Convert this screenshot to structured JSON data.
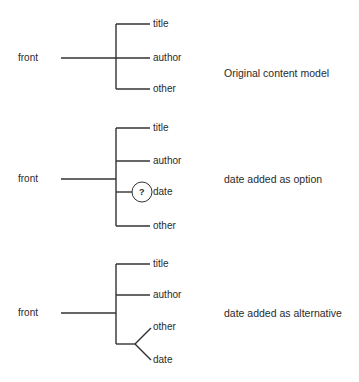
{
  "diagrams": [
    {
      "root": "front",
      "children": [
        "title",
        "author",
        "other"
      ],
      "caption": "Original content model"
    },
    {
      "root": "front",
      "children": [
        "title",
        "author",
        "date",
        "other"
      ],
      "optional_marker": "?",
      "caption": "date added as option"
    },
    {
      "root": "front",
      "children": [
        "title",
        "author",
        "other",
        "date"
      ],
      "caption": "date added as alternative"
    }
  ]
}
